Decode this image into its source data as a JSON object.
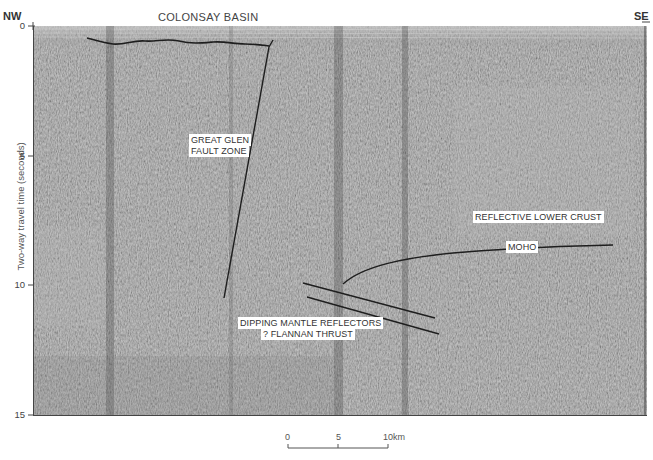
{
  "figure": {
    "title": "COLONSAY BASIN",
    "left_direction": "NW",
    "right_direction": "SE",
    "y_axis": {
      "label": "Two-way travel time (seconds)",
      "ticks": [
        {
          "value": "0",
          "y": 26
        },
        {
          "value": "5",
          "y": 156
        },
        {
          "value": "10",
          "y": 285
        },
        {
          "value": "15",
          "y": 415
        }
      ]
    },
    "annotations": {
      "fault_zone_line1": "GREAT GLEN",
      "fault_zone_line2": "FAULT ZONE",
      "lower_crust": "REFLECTIVE LOWER CRUST",
      "moho": "MOHO",
      "dipping_mantle": "DIPPING MANTLE REFLECTORS",
      "flannan": "? FLANNAN THRUST"
    },
    "scale_bar": {
      "ticks": [
        "0",
        "5",
        "10km"
      ]
    },
    "colors": {
      "section_bg": "#8c8c8c",
      "interpretation_line": "#1e1e1e",
      "label_bg": "#ffffff"
    }
  }
}
